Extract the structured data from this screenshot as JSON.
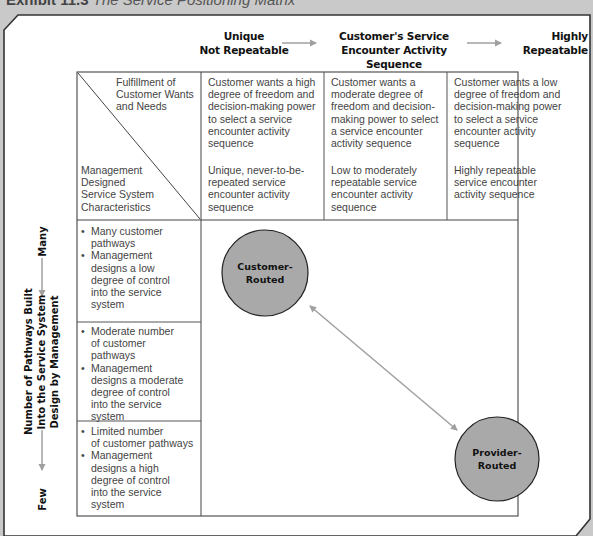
{
  "caption": {
    "exhibit": "Exhibit 11.3",
    "title": "The Service Positioning Matrix"
  },
  "top_axis": {
    "left_label_line1": "Unique",
    "left_label_line2": "Not Repeatable",
    "center_label_line1": "Customer's Service",
    "center_label_line2": "Encounter Activity Sequence",
    "right_label_line1": "Highly",
    "right_label_line2": "Repeatable"
  },
  "corner_cell": {
    "top_right_text": [
      "Fulfillment of",
      "Customer Wants",
      "and Needs"
    ],
    "bottom_left_text": [
      "Management",
      "Designed",
      "Service System",
      "Characteristics"
    ]
  },
  "columns": [
    {
      "wants": [
        "Customer wants a high",
        "degree of freedom and",
        "decision-making power",
        "to select a service",
        "encounter activity",
        "sequence"
      ],
      "characteristics": [
        "Unique, never-to-be-",
        "repeated service",
        "encounter activity",
        "sequence"
      ]
    },
    {
      "wants": [
        "Customer wants a",
        "moderate degree of",
        "freedom and decision-",
        "making power to select",
        "a service encounter",
        "activity sequence"
      ],
      "characteristics": [
        "Low to moderately",
        "repeatable service",
        "encounter activity",
        "sequence"
      ]
    },
    {
      "wants": [
        "Customer wants a low",
        "degree of freedom and",
        "decision-making power",
        "to select a service",
        "encounter activity",
        "sequence"
      ],
      "characteristics": [
        "Highly repeatable",
        "service encounter",
        "activity sequence"
      ]
    }
  ],
  "rows": [
    {
      "bullets": [
        [
          "Many customer",
          "pathways"
        ],
        [
          "Management",
          "designs a low",
          "degree of control",
          "into the service",
          "system"
        ]
      ]
    },
    {
      "bullets": [
        [
          "Moderate number",
          "of customer",
          "pathways"
        ],
        [
          "Management",
          "designs a moderate",
          "degree of control",
          "into the service",
          "system"
        ]
      ]
    },
    {
      "bullets": [
        [
          "Limited number",
          "of customer pathways"
        ],
        [
          "Management",
          "designs a high",
          "degree of control",
          "into the service",
          "system"
        ]
      ]
    }
  ],
  "left_axis": {
    "top_label": "Many",
    "bottom_label": "Few",
    "title_line1": "Number of Pathways Built",
    "title_line2": "Into the Service System",
    "title_line3": "Design by Management"
  },
  "nodes": [
    {
      "id": "customer-routed",
      "line1": "Customer-",
      "line2": "Routed"
    },
    {
      "id": "provider-routed",
      "line1": "Provider-",
      "line2": "Routed"
    }
  ],
  "colors": {
    "background": "#c9c9c9",
    "frame_fill": "#ffffff",
    "circle_fill": "#a8a8a8",
    "arrow": "#a0a0a0",
    "grid": "#555555"
  }
}
